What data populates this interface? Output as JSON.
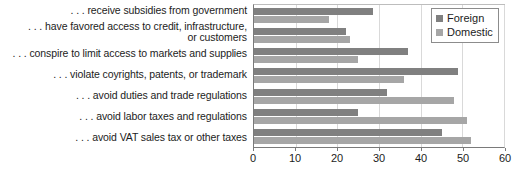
{
  "chart_data": {
    "type": "bar",
    "orientation": "horizontal",
    "title": "",
    "subtitle": "",
    "xlabel": "",
    "ylabel": "",
    "xlim": [
      0,
      60
    ],
    "xticks": [
      0,
      10,
      20,
      30,
      40,
      50,
      60
    ],
    "xtick_labels": [
      "0",
      "10",
      "20",
      "30",
      "40",
      "50",
      "60"
    ],
    "grid": true,
    "legend_position": "top-right",
    "categories": [
      ". . . receive subsidies from government",
      ". . . have favored access to credit, infrastructure,\nor customers",
      ". . . conspire to limit access to markets and supplies",
      ". . . violate coyrights, patents, or trademark",
      ". . . avoid duties and trade regulations",
      ". . . avoid labor taxes and regulations",
      ". . . avoid VAT sales tax or other taxes"
    ],
    "series": [
      {
        "name": "Foreign",
        "color": "#808080",
        "values": [
          28.5,
          22,
          37,
          49,
          32,
          25,
          45
        ]
      },
      {
        "name": "Domestic",
        "color": "#a6a6a6",
        "values": [
          18,
          23,
          25,
          36,
          48,
          51,
          52
        ]
      }
    ]
  },
  "legend": {
    "entries": [
      {
        "label": "Foreign"
      },
      {
        "label": "Domestic"
      }
    ]
  }
}
